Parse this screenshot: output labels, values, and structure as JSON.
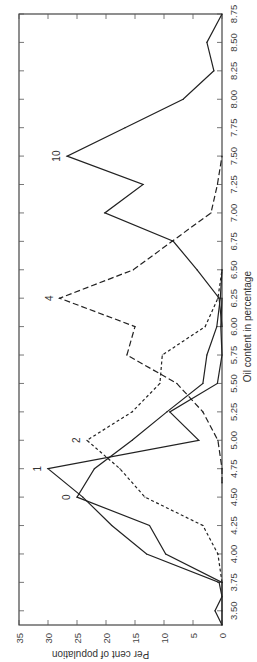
{
  "chart_data": {
    "type": "line",
    "orientation": "rotated-90-clockwise",
    "title": "",
    "xlabel": "Oil content in percentage",
    "ylabel": "Per cent of population",
    "xlim": [
      3.375,
      8.75
    ],
    "ylim": [
      0,
      35
    ],
    "x_ticks": [
      "3.50",
      "3.75",
      "4.00",
      "4.25",
      "4.50",
      "4.75",
      "5.00",
      "5.25",
      "5.50",
      "5.75",
      "6.00",
      "6.25",
      "6.50",
      "6.75",
      "7.00",
      "7.25",
      "7.50",
      "7.75",
      "8.00",
      "8.25",
      "8.50",
      "8.75"
    ],
    "y_ticks": [
      "0",
      "5",
      "10",
      "15",
      "20",
      "25",
      "30",
      "35"
    ],
    "grid": false,
    "legend": "inline-labels",
    "series": [
      {
        "name": "0",
        "style": "solid",
        "x": [
          3.375,
          3.5,
          3.75,
          4.0,
          4.25,
          4.5,
          4.75,
          5.0,
          5.25,
          5.5,
          5.75,
          6.0,
          6.25,
          6.5
        ],
        "values": [
          0,
          0,
          0,
          9.7,
          12.5,
          25,
          22,
          15.5,
          9.5,
          3.3,
          2.6,
          0.9,
          0.3,
          0
        ]
      },
      {
        "name": "1",
        "style": "solid",
        "x": [
          3.375,
          3.5,
          3.625,
          3.75,
          4.0,
          4.25,
          4.5,
          4.75,
          5.0,
          5.25,
          5.5,
          5.75,
          6.0,
          6.25
        ],
        "values": [
          0,
          1.2,
          0,
          0.5,
          13,
          19,
          24,
          30,
          4,
          9,
          0.8,
          0,
          0.2,
          0
        ]
      },
      {
        "name": "2",
        "style": "short-dash",
        "x": [
          3.75,
          4.0,
          4.25,
          4.5,
          4.75,
          5.0,
          5.25,
          5.5,
          5.75,
          6.0,
          6.25,
          6.5
        ],
        "values": [
          0,
          0.7,
          3.3,
          13.3,
          17.6,
          23.3,
          15.5,
          10.7,
          10.3,
          2.9,
          0.7,
          0
        ]
      },
      {
        "name": "4",
        "style": "long-dash",
        "x": [
          4.625,
          4.75,
          5.0,
          5.25,
          5.5,
          5.75,
          6.0,
          6.25,
          6.5,
          6.75,
          7.0,
          7.25,
          7.5
        ],
        "values": [
          0,
          0,
          0.7,
          3.3,
          7.8,
          16.4,
          15,
          28,
          15.3,
          8.6,
          1.9,
          0.8,
          0
        ]
      },
      {
        "name": "10",
        "style": "solid",
        "x": [
          6.0,
          6.25,
          6.5,
          6.75,
          7.0,
          7.25,
          7.5,
          7.75,
          8.0,
          8.25,
          8.5,
          8.75
        ],
        "values": [
          0,
          0.5,
          4.3,
          8.4,
          20.2,
          13.6,
          26.7,
          16.7,
          6.7,
          1.4,
          2.6,
          0
        ]
      }
    ],
    "labels": [
      {
        "series": "0",
        "text": "0",
        "at_x": 4.5
      },
      {
        "series": "1",
        "text": "1",
        "at_x": 4.75
      },
      {
        "series": "2",
        "text": "2",
        "at_x": 5.0
      },
      {
        "series": "4",
        "text": "4",
        "at_x": 6.25
      },
      {
        "series": "10",
        "text": "10",
        "at_x": 7.5
      }
    ]
  }
}
